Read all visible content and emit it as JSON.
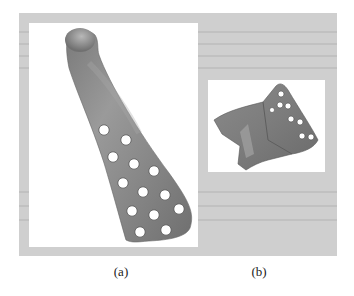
{
  "figure": {
    "panels": [
      {
        "id": "a",
        "label": "(a)",
        "subject": "elongated bone plate with rounded knob and 13 screw holes"
      },
      {
        "id": "b",
        "label": "(b)",
        "subject": "angled bone plate block with 8 screw holes"
      }
    ],
    "colors": {
      "page_background": "#ffffff",
      "scan_frame": "#cfcfcf",
      "panel_background": "#ffffff",
      "plate_gray": "#8e8e8e",
      "plate_highlight": "#b4b4b4",
      "plate_shadow": "#6c6c6c",
      "hole_fill": "#ffffff"
    }
  }
}
